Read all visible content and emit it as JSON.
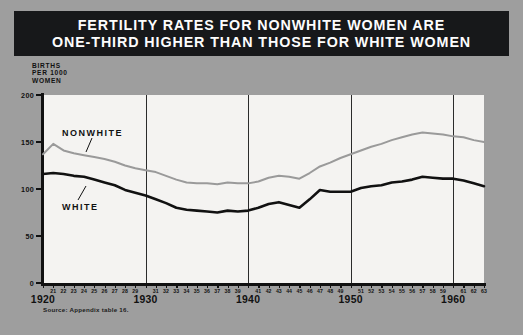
{
  "title": {
    "line1": "FERTILITY RATES FOR NONWHITE WOMEN ARE",
    "line2": "ONE-THIRD HIGHER THAN THOSE FOR WHITE WOMEN"
  },
  "axis_caption": {
    "line1": "BIRTHS",
    "line2": "PER 1000",
    "line3": "WOMEN"
  },
  "source": "Source: Appendix table 16.",
  "series_labels": {
    "nonwhite": "NONWHITE",
    "white": "WHITE"
  },
  "colors": {
    "banner": "#17181a",
    "banner_text": "#fdfdfd",
    "page_background": "#9e9e9e",
    "plot_background": "#f4f3f1",
    "white_series": "#111111",
    "nonwhite_series": "#9a9a9a",
    "axis": "#111111",
    "gridline": "#2b2b2b"
  },
  "chart_data": {
    "type": "line",
    "title": "FERTILITY RATES FOR NONWHITE WOMEN ARE ONE-THIRD HIGHER THAN THOSE FOR WHITE WOMEN",
    "xlabel": "",
    "ylabel": "BIRTHS PER 1000 WOMEN",
    "xlim": [
      1920,
      1963
    ],
    "ylim": [
      0,
      200
    ],
    "yticks": [
      0,
      50,
      100,
      150,
      200
    ],
    "ytick_labels": [
      "0",
      "50",
      "100",
      "150",
      "200"
    ],
    "grid": true,
    "gridline_years": [
      1930,
      1940,
      1950,
      1960
    ],
    "legend": "inline-labels",
    "x": [
      1920,
      1921,
      1922,
      1923,
      1924,
      1925,
      1926,
      1927,
      1928,
      1929,
      1930,
      1931,
      1932,
      1933,
      1934,
      1935,
      1936,
      1937,
      1938,
      1939,
      1940,
      1941,
      1942,
      1943,
      1944,
      1945,
      1946,
      1947,
      1948,
      1949,
      1950,
      1951,
      1952,
      1953,
      1954,
      1955,
      1956,
      1957,
      1958,
      1959,
      1960,
      1961,
      1962,
      1963
    ],
    "xtick_minor_labels": [
      "21",
      "22",
      "23",
      "24",
      "25",
      "26",
      "27",
      "28",
      "29",
      "31",
      "32",
      "33",
      "34",
      "35",
      "36",
      "37",
      "38",
      "39",
      "41",
      "42",
      "43",
      "44",
      "45",
      "46",
      "47",
      "48",
      "49",
      "51",
      "52",
      "53",
      "54",
      "55",
      "56",
      "57",
      "58",
      "59",
      "61",
      "62",
      "63"
    ],
    "xtick_decade_labels": [
      "1920",
      "1930",
      "1940",
      "1950",
      "1960"
    ],
    "series": [
      {
        "name": "NONWHITE",
        "color": "#9a9a9a",
        "values": [
          137,
          148,
          141,
          138,
          136,
          134,
          132,
          129,
          125,
          122,
          120,
          118,
          114,
          110,
          107,
          106,
          106,
          105,
          107,
          106,
          106,
          108,
          112,
          114,
          113,
          111,
          117,
          124,
          128,
          133,
          137,
          141,
          145,
          148,
          152,
          155,
          158,
          160,
          159,
          158,
          156,
          155,
          152,
          150
        ]
      },
      {
        "name": "WHITE",
        "color": "#111111",
        "values": [
          116,
          117,
          116,
          114,
          113,
          110,
          107,
          104,
          99,
          96,
          93,
          89,
          85,
          80,
          78,
          77,
          76,
          75,
          77,
          76,
          77,
          80,
          84,
          86,
          83,
          80,
          89,
          99,
          97,
          97,
          97,
          101,
          103,
          104,
          107,
          108,
          110,
          113,
          112,
          111,
          111,
          109,
          106,
          103
        ]
      }
    ]
  }
}
